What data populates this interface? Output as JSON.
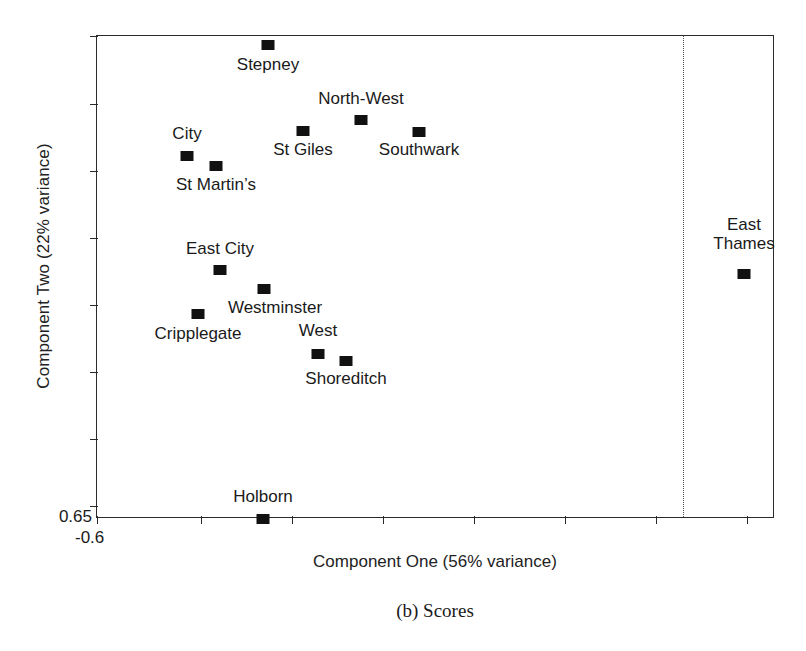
{
  "chart_data": {
    "type": "scatter",
    "title": "(b) Scores",
    "xlabel": "Component One (56% variance)",
    "ylabel": "Component Two (22% variance)",
    "x_tick_label": "-0.6",
    "y_tick_label": "0.65",
    "grid": false,
    "legend": false,
    "annotations": [
      {
        "name": "vertical-dotted-line",
        "kind": "vline",
        "x_px": 682
      }
    ],
    "points": [
      {
        "label": "Stepney",
        "x_px": 267,
        "y_px": 44,
        "label_x_px": 267,
        "label_y_px": 54,
        "lines": [
          "Stepney"
        ]
      },
      {
        "label": "North-West",
        "x_px": 360,
        "y_px": 119,
        "label_x_px": 360,
        "label_y_px": 88,
        "lines": [
          "North-West"
        ]
      },
      {
        "label": "St Giles",
        "x_px": 302,
        "y_px": 130,
        "label_x_px": 302,
        "label_y_px": 139,
        "lines": [
          "St Giles"
        ]
      },
      {
        "label": "Southwark",
        "x_px": 418,
        "y_px": 131,
        "label_x_px": 418,
        "label_y_px": 139,
        "lines": [
          "Southwark"
        ]
      },
      {
        "label": "City",
        "x_px": 186,
        "y_px": 155,
        "label_x_px": 186,
        "label_y_px": 123,
        "lines": [
          "City"
        ]
      },
      {
        "label": "St Martin's",
        "x_px": 215,
        "y_px": 165,
        "label_x_px": 215,
        "label_y_px": 174,
        "lines": [
          "St Martin’s"
        ]
      },
      {
        "label": "East City",
        "x_px": 219,
        "y_px": 269,
        "label_x_px": 219,
        "label_y_px": 238,
        "lines": [
          "East City"
        ]
      },
      {
        "label": "Westminster",
        "x_px": 263,
        "y_px": 288,
        "label_x_px": 274,
        "label_y_px": 297,
        "lines": [
          "Westminster"
        ]
      },
      {
        "label": "Cripplegate",
        "x_px": 197,
        "y_px": 313,
        "label_x_px": 197,
        "label_y_px": 323,
        "lines": [
          "Cripplegate"
        ]
      },
      {
        "label": "West",
        "x_px": 317,
        "y_px": 353,
        "label_x_px": 317,
        "label_y_px": 320,
        "lines": [
          "West"
        ]
      },
      {
        "label": "Shoreditch",
        "x_px": 345,
        "y_px": 360,
        "label_x_px": 345,
        "label_y_px": 368,
        "lines": [
          "Shoreditch"
        ]
      },
      {
        "label": "East Thames",
        "x_px": 743,
        "y_px": 273,
        "label_x_px": 743,
        "label_y_px": 214,
        "lines": [
          "East",
          "Thames"
        ]
      },
      {
        "label": "Holborn",
        "x_px": 262,
        "y_px": 518,
        "label_x_px": 262,
        "label_y_px": 486,
        "lines": [
          "Holborn"
        ]
      }
    ],
    "x_ticks_px": [
      96,
      200,
      291,
      382,
      473,
      564,
      655,
      746
    ],
    "y_ticks_px": [
      35,
      103,
      170,
      237,
      304,
      371,
      438,
      505
    ]
  }
}
